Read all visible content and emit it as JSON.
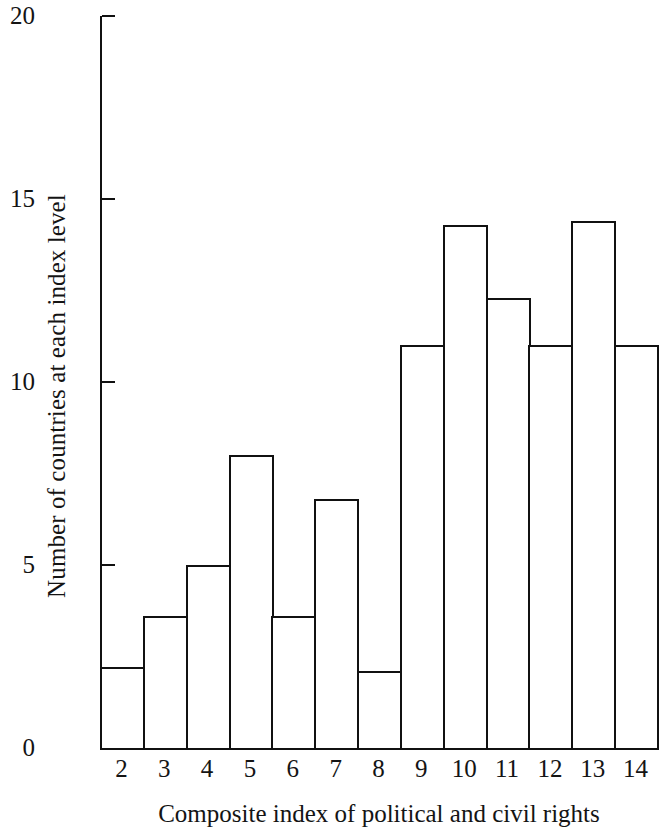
{
  "chart_data": {
    "type": "bar",
    "title": "",
    "subtitle": "",
    "xlabel": "Composite index of political and civil rights",
    "ylabel": "Number of countries at each index level",
    "categories": [
      "2",
      "3",
      "4",
      "5",
      "6",
      "7",
      "8",
      "9",
      "10",
      "11",
      "12",
      "13",
      "14"
    ],
    "values": [
      2.2,
      3.6,
      5.0,
      8.0,
      3.6,
      6.8,
      2.1,
      11.0,
      14.3,
      12.3,
      11.0,
      14.4,
      11.0
    ],
    "xlim": [
      2,
      15
    ],
    "ylim": [
      0,
      20
    ],
    "ytick_labels": [
      "20",
      "15",
      "10",
      "5",
      "0"
    ],
    "ytick_values": [
      20,
      15,
      10,
      5,
      0
    ],
    "grid": false,
    "legend": null,
    "bar_fill": "#ffffff",
    "bar_edge": "#111111",
    "axis_color": "#111111",
    "background": "#ffffff",
    "annotations": []
  }
}
